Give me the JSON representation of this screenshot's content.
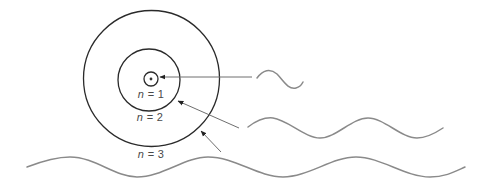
{
  "diagram": {
    "title": "",
    "colors": {
      "orbit": "#2a2a2a",
      "wave": "#8a8a8a",
      "arrow": "#6e6e6e",
      "text": "#4a4a4a",
      "background": "#ffffff"
    },
    "orbits": [
      {
        "n": 1,
        "label_var": "n",
        "label_rest": " = 1",
        "radius": 7
      },
      {
        "n": 2,
        "label_var": "n",
        "label_rest": " = 2",
        "radius": 31
      },
      {
        "n": 3,
        "label_var": "n",
        "label_rest": " = 3",
        "radius": 68
      }
    ],
    "waves": [
      {
        "id": "short-wavelength",
        "target_orbit": 1
      },
      {
        "id": "medium-wavelength",
        "target_orbit": 2
      },
      {
        "id": "long-wavelength",
        "target_orbit": 3
      }
    ]
  }
}
